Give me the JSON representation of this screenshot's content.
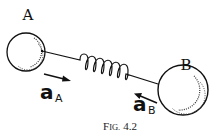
{
  "figure": {
    "caption_prefix": "F",
    "caption_smallcaps": "IG.",
    "caption_number": "4.2",
    "caption_full": "Fig. 4.2"
  },
  "bodies": [
    {
      "id": "A",
      "label": "A",
      "center": [
        26,
        52
      ],
      "radius": 19
    },
    {
      "id": "B",
      "label": "B",
      "center": [
        183,
        90
      ],
      "radius": 25
    }
  ],
  "spring": {
    "from": "A",
    "to": "B",
    "coils": 6
  },
  "vectors": [
    {
      "id": "aA",
      "symbol": "a",
      "subscript": "A",
      "direction": "toward B"
    },
    {
      "id": "aB",
      "symbol": "a",
      "subscript": "B",
      "direction": "toward A"
    }
  ],
  "colors": {
    "ink": "#111111",
    "background": "#ffffff"
  }
}
